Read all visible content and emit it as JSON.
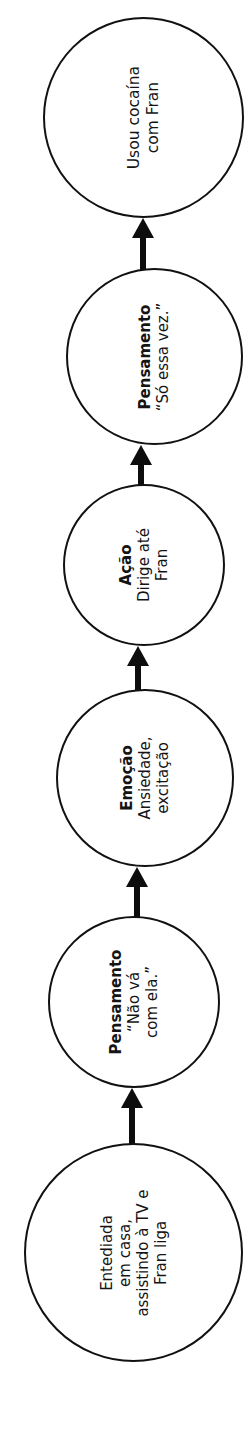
{
  "diagram": {
    "type": "flowchart-chain",
    "orientation": "vertical-bottom-to-top",
    "text_rotation_deg": -90,
    "colors": {
      "stroke": "#111111",
      "fill": "#ffffff",
      "text": "#141414",
      "arrow": "#0d0d0d"
    },
    "nodes": [
      {
        "id": "outcome",
        "title": "",
        "lines": [
          "Usou cocaína",
          "com Fran"
        ]
      },
      {
        "id": "thought-2",
        "title": "Pensamento",
        "lines": [
          "“Só essa vez.”"
        ]
      },
      {
        "id": "action",
        "title": "Ação",
        "lines": [
          "Dirige até",
          "Fran"
        ]
      },
      {
        "id": "emotion",
        "title": "Emoção",
        "lines": [
          "Ansiedade,",
          "excitação"
        ]
      },
      {
        "id": "thought-1",
        "title": "Pensamento",
        "lines": [
          "“Não vá",
          "com ela.”"
        ]
      },
      {
        "id": "trigger",
        "title": "",
        "lines": [
          "Entediada",
          "em casa,",
          "assistindo à TV e",
          "Fran liga"
        ]
      }
    ],
    "arrows": [
      {
        "id": "arrow-trigger-to-thought1",
        "direction": "up"
      },
      {
        "id": "arrow-thought1-to-emotion",
        "direction": "up"
      },
      {
        "id": "arrow-emotion-to-action",
        "direction": "up"
      },
      {
        "id": "arrow-action-to-thought2",
        "direction": "up"
      },
      {
        "id": "arrow-thought2-to-outcome",
        "direction": "up"
      }
    ]
  }
}
